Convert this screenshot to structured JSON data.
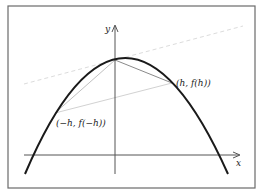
{
  "diagram": {
    "axes": {
      "x_label": "x",
      "y_label": "y"
    },
    "points": {
      "right": "(h, f(h))",
      "left": "(−h, f(−h))"
    },
    "colors": {
      "curve": "#1a1a1a",
      "axis": "#555555",
      "chord": "#8a8a8a",
      "chord_light": "#c8c8c8",
      "tangent_dashed": "#dcdcdc",
      "frame": "#6a6a6a"
    }
  }
}
